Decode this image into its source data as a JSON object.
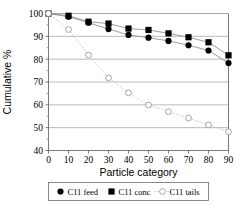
{
  "chart_data": {
    "type": "line",
    "title": "",
    "subtitle": "",
    "xlabel": "Particle category",
    "ylabel": "Cumulative %",
    "x": [
      0,
      10,
      20,
      30,
      40,
      50,
      60,
      70,
      80,
      90
    ],
    "xlim": [
      0,
      90
    ],
    "ylim": [
      40,
      100
    ],
    "xticks": [
      "0",
      "10",
      "20",
      "30",
      "40",
      "50",
      "60",
      "70",
      "80",
      "90"
    ],
    "yticks": [
      "40",
      "50",
      "60",
      "70",
      "80",
      "90",
      "100"
    ],
    "grid": "horizontal",
    "legend_position": "bottom-outside",
    "series": [
      {
        "name": "C11 feed",
        "marker": "filled-circle",
        "linestyle": "solid",
        "color": "#000000",
        "linecolor": "#8c8c8c",
        "values": [
          100,
          98.6,
          96.0,
          93.2,
          90.6,
          89.4,
          88.0,
          86.1,
          83.8,
          78.3
        ]
      },
      {
        "name": "C11 conc",
        "marker": "filled-square",
        "linestyle": "solid",
        "color": "#000000",
        "linecolor": "#8c8c8c",
        "values": [
          100,
          99.0,
          96.4,
          95.6,
          93.4,
          92.8,
          91.3,
          89.6,
          87.4,
          81.7
        ]
      },
      {
        "name": "C11 tails",
        "marker": "open-circle",
        "linestyle": "dotted",
        "color": "#9a9a9a",
        "linecolor": "#b4b4b4",
        "values": [
          100,
          93.0,
          81.8,
          71.8,
          65.3,
          59.9,
          57.0,
          54.2,
          51.2,
          48.2
        ]
      }
    ]
  },
  "legend": {
    "items": [
      {
        "label": "C11 feed",
        "marker": "filled-circle-icon"
      },
      {
        "label": "C11 conc",
        "marker": "filled-square-icon"
      },
      {
        "label": "C11 tails",
        "marker": "open-circle-icon"
      }
    ]
  },
  "colors": {
    "axis": "#6b6b6b",
    "grid": "#9c9c9c",
    "marker_dark": "#000000",
    "marker_light": "#9a9a9a",
    "line_gray": "#8c8c8c",
    "background": "#ffffff"
  }
}
